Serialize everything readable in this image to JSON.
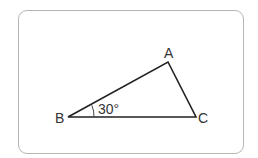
{
  "diagram": {
    "type": "triangle",
    "vertices": {
      "A": {
        "label": "A",
        "x": 168,
        "y": 62
      },
      "B": {
        "label": "B",
        "x": 68,
        "y": 117
      },
      "C": {
        "label": "C",
        "x": 196,
        "y": 117
      }
    },
    "angle": {
      "vertex": "B",
      "label": "30°"
    },
    "colors": {
      "stroke": "#222222",
      "frame": "#b5b5b5",
      "text": "#333333"
    }
  }
}
